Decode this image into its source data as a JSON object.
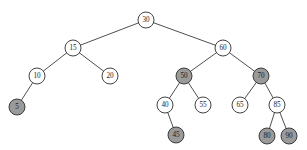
{
  "figure": {
    "background_color": "#ffffff",
    "width": 307,
    "height": 150
  },
  "style": {
    "node_radius": 8,
    "node_fill_white": "#ffffff",
    "node_fill_shaded": "#9a9a9a",
    "node_stroke": "#2e2e2e",
    "edge_color": "#3b3b3b",
    "label_color": "#1a1a1a"
  },
  "tree": {
    "root_value": "30",
    "nodes": [
      {
        "id": "n30",
        "label": "30",
        "x": 146,
        "y": 20,
        "shaded": false
      },
      {
        "id": "n15",
        "label": "15",
        "x": 73,
        "y": 48,
        "shaded": false
      },
      {
        "id": "n60",
        "label": "60",
        "x": 223,
        "y": 48,
        "shaded": false
      },
      {
        "id": "n10",
        "label": "10",
        "x": 37,
        "y": 76,
        "shaded": false
      },
      {
        "id": "n20",
        "label": "20",
        "x": 110,
        "y": 76,
        "shaded": false
      },
      {
        "id": "n50",
        "label": "50",
        "x": 184,
        "y": 76,
        "shaded": true
      },
      {
        "id": "n70",
        "label": "70",
        "x": 261,
        "y": 76,
        "shaded": true
      },
      {
        "id": "n5",
        "label": "5",
        "x": 17,
        "y": 107,
        "shaded": true
      },
      {
        "id": "n40",
        "label": "40",
        "x": 165,
        "y": 105,
        "shaded": false
      },
      {
        "id": "n55",
        "label": "55",
        "x": 203,
        "y": 105,
        "shaded": false
      },
      {
        "id": "n65",
        "label": "65",
        "x": 240,
        "y": 105,
        "shaded": false
      },
      {
        "id": "n85",
        "label": "85",
        "x": 277,
        "y": 105,
        "shaded": false
      },
      {
        "id": "n45",
        "label": "45",
        "x": 176,
        "y": 135,
        "shaded": true
      },
      {
        "id": "n80",
        "label": "80",
        "x": 267,
        "y": 136,
        "shaded": true
      },
      {
        "id": "n90",
        "label": "90",
        "x": 289,
        "y": 136,
        "shaded": true
      }
    ],
    "edges": [
      {
        "from": "n30",
        "to": "n15"
      },
      {
        "from": "n30",
        "to": "n60"
      },
      {
        "from": "n15",
        "to": "n10"
      },
      {
        "from": "n15",
        "to": "n20"
      },
      {
        "from": "n60",
        "to": "n50"
      },
      {
        "from": "n60",
        "to": "n70"
      },
      {
        "from": "n10",
        "to": "n5"
      },
      {
        "from": "n50",
        "to": "n40"
      },
      {
        "from": "n50",
        "to": "n55"
      },
      {
        "from": "n70",
        "to": "n65"
      },
      {
        "from": "n70",
        "to": "n85"
      },
      {
        "from": "n40",
        "to": "n45"
      },
      {
        "from": "n85",
        "to": "n80"
      },
      {
        "from": "n85",
        "to": "n90"
      }
    ]
  }
}
